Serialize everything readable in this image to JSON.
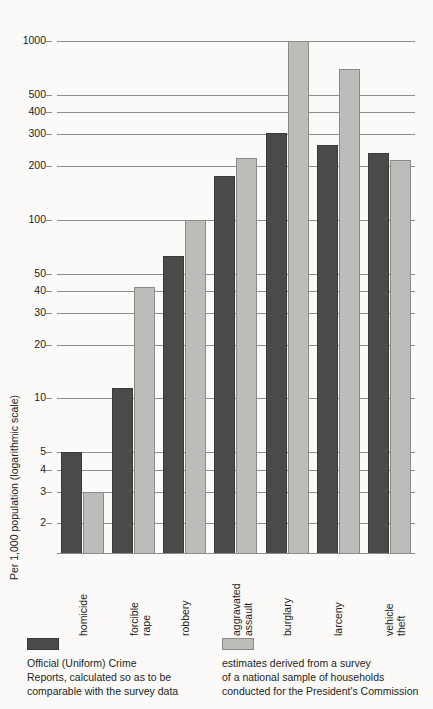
{
  "chart_data": {
    "type": "bar",
    "title": "",
    "xlabel": "",
    "ylabel": "Per 1,000 population (logarithmic scale)",
    "scale": "log",
    "ylim": [
      1.35,
      1150
    ],
    "grid": true,
    "legend_position": "bottom",
    "yticks": [
      1000,
      500,
      400,
      300,
      200,
      100,
      50,
      40,
      30,
      20,
      10,
      5,
      4,
      3,
      2
    ],
    "ytick_labels": [
      "1000",
      "500",
      "400",
      "300",
      "200",
      "100",
      "50",
      "40",
      "30",
      "20",
      "10",
      "5",
      "4",
      "3",
      "2"
    ],
    "categories": [
      "homicide",
      "forcible rape",
      "robbery",
      "aggravated assault",
      "burglary",
      "larceny",
      "vehicle theft"
    ],
    "category_lines": [
      [
        "homicide"
      ],
      [
        "forcible",
        "rape"
      ],
      [
        "robbery"
      ],
      [
        "aggravated",
        "assault"
      ],
      [
        "burglary"
      ],
      [
        "larceny"
      ],
      [
        "vehicle",
        "theft"
      ]
    ],
    "series": [
      {
        "name": "Official (Uniform) Crime Reports, calculated so as to be comparable with the survey data",
        "color": "#4b4a48",
        "values": [
          5.0,
          11.5,
          63,
          175,
          305,
          260,
          235
        ]
      },
      {
        "name": "estimates derived from a survey of a national sample of households conducted for the President's Commission",
        "color": "#bdbcb8",
        "values": [
          3.0,
          42,
          100,
          220,
          1000,
          700,
          215
        ]
      }
    ]
  },
  "axis": {
    "y_title": "Per 1,000 population (logarithmic scale)"
  },
  "legend": {
    "items": [
      {
        "swatch": "dark",
        "lines": [
          "Official (Uniform) Crime",
          "Reports, calculated so as to be",
          "comparable with the survey data"
        ]
      },
      {
        "swatch": "light",
        "lines": [
          "estimates derived from a survey",
          "of a national sample of households",
          "conducted for the President's Commission"
        ]
      }
    ]
  }
}
